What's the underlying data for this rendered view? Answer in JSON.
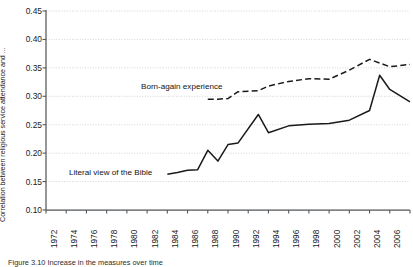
{
  "figure": {
    "caption_prefix": "Figure",
    "caption_number": "3.10",
    "caption_text": "Figure  3.10  Increase in the measures over time"
  },
  "axes": {
    "ylabel": "Correlation between religious service attendance and ...",
    "yticks": [
      "0.45",
      "0.40",
      "0.35",
      "0.30",
      "0.25",
      "0.20",
      "0.15",
      "0.10"
    ],
    "xticks": [
      "1972",
      "1974",
      "1976",
      "1978",
      "1980",
      "1982",
      "1984",
      "1986",
      "1988",
      "1990",
      "1992",
      "1994",
      "1996",
      "1998",
      "2000",
      "2002",
      "2004",
      "2006",
      "2008"
    ],
    "grid": "horizontal-dotted",
    "colors": {
      "axis": "#55595c",
      "grid": "#c9c9c9",
      "line": "#1a1a1a",
      "text": "#1a1a1a"
    }
  },
  "annotations": [
    {
      "name": "born-again-label",
      "text": "Born-again experience"
    },
    {
      "name": "literal-bible-label",
      "text": "Literal view of the Bible"
    }
  ],
  "chart_data": {
    "type": "line",
    "title": "",
    "xlabel": "",
    "ylabel": "Correlation between religious service attendance and ...",
    "xlim": [
      1972,
      2008
    ],
    "ylim": [
      0.1,
      0.45
    ],
    "yticks": [
      0.1,
      0.15,
      0.2,
      0.25,
      0.3,
      0.35,
      0.4,
      0.45
    ],
    "xticks": [
      1972,
      1974,
      1976,
      1978,
      1980,
      1982,
      1984,
      1986,
      1988,
      1990,
      1992,
      1994,
      1996,
      1998,
      2000,
      2002,
      2004,
      2006,
      2008
    ],
    "grid": true,
    "legend": "inline-annotations",
    "series": [
      {
        "name": "Literal view of the Bible",
        "style": "solid",
        "x": [
          1984,
          1985,
          1986,
          1987,
          1988,
          1989,
          1990,
          1991,
          1993,
          1994,
          1996,
          1998,
          2000,
          2002,
          2004,
          2005,
          2006,
          2008
        ],
        "values": [
          0.163,
          0.166,
          0.17,
          0.171,
          0.205,
          0.186,
          0.215,
          0.218,
          0.268,
          0.236,
          0.248,
          0.251,
          0.252,
          0.258,
          0.275,
          0.337,
          0.312,
          0.29
        ]
      },
      {
        "name": "Born-again experience",
        "style": "dashed",
        "x": [
          1988,
          1989,
          1990,
          1991,
          1993,
          1994,
          1996,
          1998,
          2000,
          2002,
          2004,
          2006,
          2008
        ],
        "values": [
          0.295,
          0.295,
          0.296,
          0.308,
          0.31,
          0.318,
          0.326,
          0.331,
          0.33,
          0.346,
          0.365,
          0.352,
          0.356
        ]
      }
    ]
  }
}
